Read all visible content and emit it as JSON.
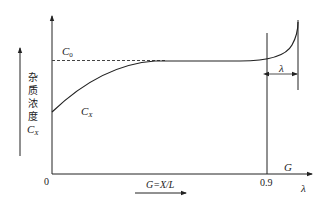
{
  "diagram": {
    "type": "impurity-concentration-profile",
    "y_axis_label_chars": [
      "杂",
      "质",
      "浓",
      "度"
    ],
    "y_axis_label_symbol": "C",
    "y_axis_label_symbol_sub": "X",
    "origin_label": "0",
    "c0_label": "C",
    "c0_label_sub": "0",
    "curve_label": "C",
    "curve_label_sub": "X",
    "x_tick_label": "0.9",
    "x_axis_label_g": "G",
    "x_axis_label_lambda": "λ",
    "zone_label": "λ",
    "bottom_formula": "G=X/L"
  },
  "colors": {
    "stroke": "#222222",
    "background": "#ffffff"
  }
}
